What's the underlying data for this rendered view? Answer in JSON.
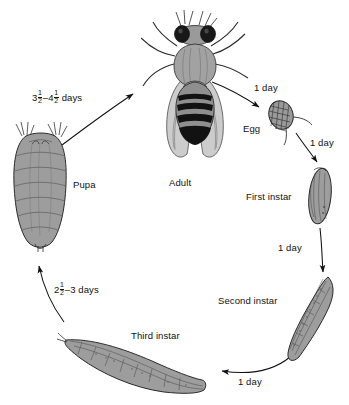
{
  "diagram": {
    "background_color": "#ffffff",
    "ink_color": "#111111",
    "organism_fill": "#9a9a9a",
    "stages": [
      {
        "id": "adult",
        "label": "Adult"
      },
      {
        "id": "egg",
        "label": "Egg"
      },
      {
        "id": "first_instar",
        "label": "First instar"
      },
      {
        "id": "second_instar",
        "label": "Second instar"
      },
      {
        "id": "third_instar",
        "label": "Third instar"
      },
      {
        "id": "pupa",
        "label": "Pupa"
      }
    ],
    "transitions": [
      {
        "id": "adult_to_egg",
        "label": "1 day"
      },
      {
        "id": "egg_to_first",
        "label": "1 day"
      },
      {
        "id": "first_to_second",
        "label": "1 day"
      },
      {
        "id": "second_to_third",
        "label": "1 day"
      },
      {
        "id": "third_to_pupa_whole",
        "label": "2½–3 days",
        "whole": "2",
        "num": "1",
        "den": "2",
        "tail": "–3 days"
      },
      {
        "id": "pupa_to_adult_whole",
        "label": "3½–4½ days",
        "whole_a": "3",
        "num_a": "1",
        "den_a": "2",
        "mid": "–4",
        "num_b": "1",
        "den_b": "2",
        "tail": " days"
      }
    ]
  }
}
